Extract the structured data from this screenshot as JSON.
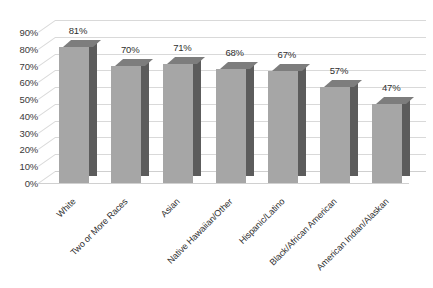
{
  "chart_data": {
    "type": "bar",
    "title": "",
    "subtitle": "",
    "xlabel": "",
    "ylabel": "",
    "categories": [
      "White",
      "Two or More Races",
      "Asian",
      "Native Hawaiian/Other",
      "Hispanic/Latino",
      "Black/African American",
      "American Indian/Alaskan"
    ],
    "values": [
      81,
      70,
      71,
      68,
      67,
      57,
      47
    ],
    "data_labels": [
      "81%",
      "70%",
      "71%",
      "68%",
      "67%",
      "57%",
      "47%"
    ],
    "ytick_labels": [
      "90%",
      "80%",
      "70%",
      "60%",
      "50%",
      "40%",
      "30%",
      "20%",
      "10%",
      "0%"
    ],
    "ytick_values": [
      90,
      80,
      70,
      60,
      50,
      40,
      30,
      20,
      10,
      0
    ],
    "ylim": [
      0,
      90
    ],
    "grid": true,
    "legend": false,
    "legend_position": "none",
    "style": "3d-column",
    "colors": {
      "bar_front": "#a6a6a6",
      "bar_side": "#5c5c5c",
      "bar_top": "#7d7d7d",
      "gridline": "#d9d9d9",
      "text": "#2f2f2f",
      "background": "#ffffff"
    }
  }
}
